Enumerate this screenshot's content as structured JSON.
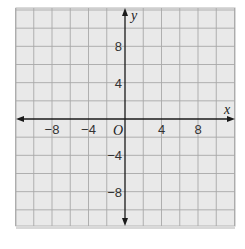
{
  "chart_data": {
    "type": "scatter",
    "title": "",
    "xlabel": "x",
    "ylabel": "y",
    "origin_label": "O",
    "xlim": [
      -12,
      12
    ],
    "ylim": [
      -12,
      12
    ],
    "grid": true,
    "grid_step": 2,
    "x_ticks": [
      -8,
      -4,
      4,
      8
    ],
    "y_ticks": [
      8,
      4,
      -4,
      -8
    ],
    "x_tick_labels": [
      "−8",
      "−4",
      "4",
      "8"
    ],
    "y_tick_labels": [
      "8",
      "4",
      "−4",
      "−8"
    ],
    "series": [],
    "colors": {
      "background": "#e9e9e9",
      "grid": "#a8a8a8",
      "axis": "#1a1a1a"
    }
  }
}
